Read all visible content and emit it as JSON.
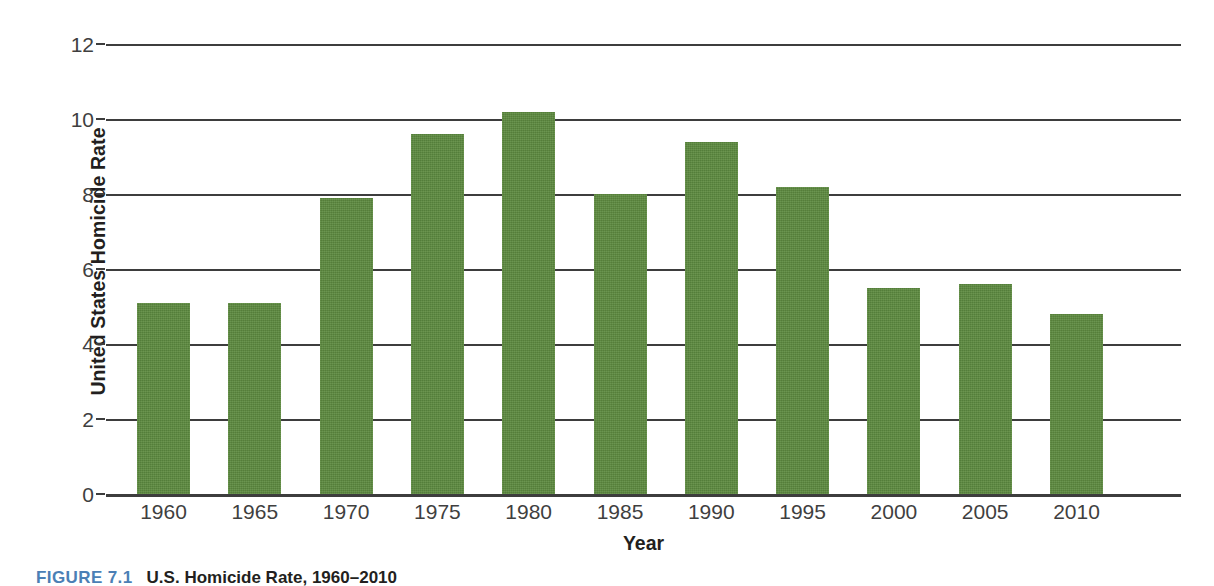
{
  "chart_data": {
    "type": "bar",
    "title": "",
    "xlabel": "Year",
    "ylabel": "United States Homicide Rate",
    "categories": [
      "1960",
      "1965",
      "1970",
      "1975",
      "1980",
      "1985",
      "1990",
      "1995",
      "2000",
      "2005",
      "2010"
    ],
    "values": [
      5.1,
      5.1,
      7.9,
      9.6,
      10.2,
      8.0,
      9.4,
      8.2,
      5.5,
      5.6,
      4.8
    ],
    "ylim": [
      0,
      12
    ],
    "yticks": [
      0,
      2,
      4,
      6,
      8,
      10,
      12
    ],
    "ytick_labels": [
      "0",
      "2",
      "4",
      "6",
      "8",
      "10",
      "12"
    ],
    "grid": true,
    "grid_axis": "y",
    "legend": "none",
    "bar_color": "#5d8a3f",
    "series": [
      {
        "name": "United States Homicide Rate",
        "values": [
          5.1,
          5.1,
          7.9,
          9.6,
          10.2,
          8.0,
          9.4,
          8.2,
          5.5,
          5.6,
          4.8
        ]
      }
    ]
  },
  "axes": {
    "y_title": "United States Homicide Rate",
    "x_title": "Year"
  },
  "caption": {
    "label": "FIGURE 7.1",
    "text": "U.S. Homicide Rate, 1960–2010",
    "label_color": "#4b7fb5"
  }
}
